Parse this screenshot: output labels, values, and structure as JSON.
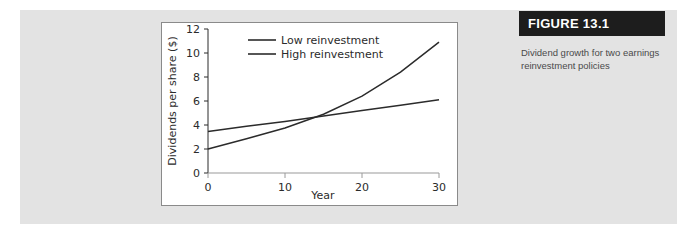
{
  "figure": {
    "header_label": "FIGURE 13.1",
    "caption": "Dividend growth for two earnings reinvestment policies",
    "header_bg": "#1d1d1d",
    "header_text_color": "#ffffff",
    "caption_color": "#4a4a4a"
  },
  "page": {
    "band_color": "#e3e3e3",
    "panel_bg": "#ffffff",
    "panel_border_color": "#8a8a8a"
  },
  "chart_data": {
    "type": "line",
    "title": "",
    "xlabel": "Year",
    "ylabel": "Dividends per share ($)",
    "xlim": [
      0,
      30
    ],
    "ylim": [
      0,
      12
    ],
    "xticks": [
      0,
      10,
      20,
      30
    ],
    "xtick_labels": [
      "0",
      "10",
      "20",
      "30"
    ],
    "yticks": [
      0,
      2,
      4,
      6,
      8,
      10,
      12
    ],
    "ytick_labels": [
      "0",
      "2",
      "4",
      "6",
      "8",
      "10",
      "12"
    ],
    "grid": false,
    "legend_position": "upper-center",
    "line_color": "#2b2b2b",
    "series": [
      {
        "name": "Low reinvestment",
        "x": [
          0,
          5,
          10,
          15,
          20,
          25,
          30
        ],
        "values": [
          3.45,
          3.9,
          4.3,
          4.75,
          5.2,
          5.65,
          6.1
        ]
      },
      {
        "name": "High reinvestment",
        "x": [
          0,
          5,
          10,
          15,
          20,
          25,
          30
        ],
        "values": [
          2.0,
          2.85,
          3.75,
          4.9,
          6.4,
          8.4,
          10.9
        ]
      }
    ],
    "annotations": [
      {
        "label": "crossover",
        "x": 13.5,
        "y": 4.6
      }
    ]
  }
}
